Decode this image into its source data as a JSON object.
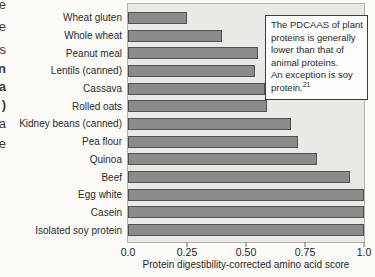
{
  "left_margin_fragments": [
    "e",
    "e",
    "s",
    "n",
    "a",
    ")",
    "a",
    "e"
  ],
  "chart_data": {
    "type": "bar",
    "orientation": "horizontal",
    "title": "",
    "categories": [
      "Wheat gluten",
      "Whole wheat",
      "Peanut meal",
      "Lentils (canned)",
      "Cassava",
      "Rolled oats",
      "Kidney beans (canned)",
      "Pea flour",
      "Quinoa",
      "Beef",
      "Egg white",
      "Casein",
      "Isolated soy protein"
    ],
    "values": [
      0.25,
      0.4,
      0.55,
      0.54,
      0.58,
      0.59,
      0.69,
      0.72,
      0.8,
      0.94,
      1.0,
      1.0,
      1.0
    ],
    "xlabel": "Protein digestibility-corrected amino acid score",
    "ylabel": "",
    "xlim": [
      0,
      1.0
    ],
    "xticks": [
      "0.0",
      "0.25",
      "0.50",
      "0.75",
      "1.0"
    ],
    "xtick_values": [
      0,
      0.25,
      0.5,
      0.75,
      1.0
    ],
    "grid": false,
    "legend_position": "none",
    "bar_color": "#8b8b8b",
    "bar_border_color": "#515151",
    "plot_background": "#e9e9e6"
  },
  "annotation_box": {
    "lines": [
      "The PDCAAS of plant",
      "proteins is generally",
      "lower than that of",
      "animal proteins.",
      "An exception is soy"
    ],
    "last_line_text": "protein.",
    "last_line_superscript": "21"
  }
}
